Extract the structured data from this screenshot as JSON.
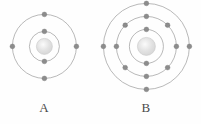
{
  "figure": {
    "background_color": "#fefefe",
    "shell_color": "#9b9b9b",
    "electron_color": "#8c8c8c",
    "nucleus_color": "#e2e2e2",
    "label_color": "#4a4a4a"
  },
  "atoms": [
    {
      "id": "atom-a",
      "label": "A",
      "center": {
        "x": 44,
        "y": 46
      },
      "nucleus_radius": 8,
      "electron_radius": 2.4,
      "total_electrons": 6,
      "shells": [
        {
          "name": "inner-shell",
          "radius": 15,
          "electron_count": 2,
          "electron_angles": [
            270,
            90
          ]
        },
        {
          "name": "outer-shell",
          "radius": 32,
          "electron_count": 4,
          "electron_angles": [
            270,
            0,
            90,
            180
          ]
        }
      ]
    },
    {
      "id": "atom-b",
      "label": "B",
      "center": {
        "x": 146,
        "y": 46
      },
      "nucleus_radius": 9,
      "electron_radius": 2.4,
      "total_electrons": 14,
      "shells": [
        {
          "name": "inner-shell",
          "radius": 17,
          "electron_count": 2,
          "electron_angles": [
            270,
            90
          ]
        },
        {
          "name": "middle-shell",
          "radius": 30,
          "electron_count": 8,
          "electron_angles": [
            270,
            315,
            0,
            45,
            90,
            135,
            180,
            225
          ]
        },
        {
          "name": "outer-shell",
          "radius": 43,
          "electron_count": 4,
          "electron_angles": [
            270,
            0,
            90,
            180
          ]
        }
      ]
    }
  ],
  "chart_data": {
    "type": "diagram",
    "title": "",
    "items": [
      {
        "label": "A",
        "shell_count": 2,
        "electrons_per_shell": [
          2,
          4
        ],
        "total_electrons": 6
      },
      {
        "label": "B",
        "shell_count": 3,
        "electrons_per_shell": [
          2,
          8,
          4
        ],
        "total_electrons": 14
      }
    ]
  }
}
